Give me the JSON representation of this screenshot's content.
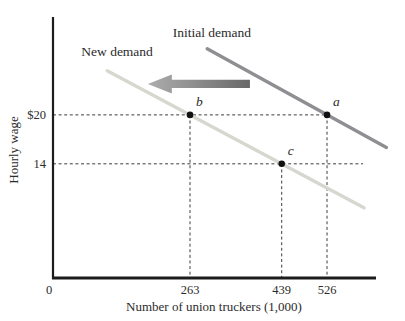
{
  "figure": {
    "background": "#ffffff"
  },
  "colors": {
    "axis": "#1c1c1c",
    "text": "#2b2b2b",
    "guide": "#3d3d3d",
    "marker": "#111111",
    "arrow_gradient_left": "#adadad",
    "arrow_gradient_right": "#686868"
  },
  "chart_data": {
    "type": "line",
    "title": "",
    "xlabel": "Number of union truckers (1,000)",
    "ylabel": "Hourly wage",
    "xlim": [
      0,
      620
    ],
    "ylim": [
      0,
      32
    ],
    "grid": false,
    "legend": "inline-labels",
    "x_ticks": [
      {
        "value": 0,
        "label": "0"
      },
      {
        "value": 263,
        "label": "263"
      },
      {
        "value": 439,
        "label": "439"
      },
      {
        "value": 526,
        "label": "526"
      }
    ],
    "y_ticks": [
      {
        "value": 20,
        "label": "$20"
      },
      {
        "value": 14,
        "label": "14"
      }
    ],
    "series": [
      {
        "name": "Initial demand",
        "color": "#8f8f93",
        "points": [
          [
            296,
            28.1
          ],
          [
            640,
            16.0
          ]
        ],
        "label_pos": {
          "q": 305,
          "wage": 29.55
        }
      },
      {
        "name": "New demand",
        "color": "#d6d8d0",
        "points": [
          [
            104,
            25.4
          ],
          [
            597,
            8.6
          ]
        ],
        "label_pos": {
          "q": 123,
          "wage": 27.2
        }
      }
    ],
    "markers": [
      {
        "label": "a",
        "q": 526,
        "wage": 20,
        "series": "Initial demand"
      },
      {
        "label": "b",
        "q": 263,
        "wage": 20,
        "series": "New demand"
      },
      {
        "label": "c",
        "q": 439,
        "wage": 14,
        "series": "New demand"
      }
    ],
    "guides": [
      {
        "orientation": "horizontal",
        "wage": 20,
        "q_start": 0,
        "q_end": 526
      },
      {
        "orientation": "horizontal",
        "wage": 14,
        "q_start": 0,
        "q_end": 595
      },
      {
        "orientation": "vertical",
        "q": 263,
        "wage_start": 0,
        "wage_end": 20
      },
      {
        "orientation": "vertical",
        "q": 439,
        "wage_start": 0,
        "wage_end": 14
      },
      {
        "orientation": "vertical",
        "q": 526,
        "wage_start": 0,
        "wage_end": 20
      }
    ],
    "shift_arrow": {
      "direction": "left",
      "wage": 23.8,
      "q_tip": 182,
      "q_tail": 378
    }
  }
}
